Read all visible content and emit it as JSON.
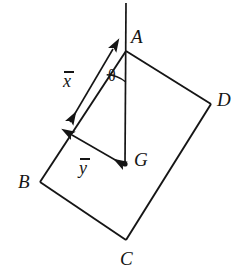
{
  "figure": {
    "background_color": "#ffffff",
    "stroke_color": "#151515",
    "canvas": {
      "width": 238,
      "height": 276
    }
  },
  "vertices": [
    {
      "id": "A",
      "label": "A",
      "point": [
        126,
        51
      ],
      "label_pos": [
        131,
        27
      ]
    },
    {
      "id": "B",
      "label": "B",
      "point": [
        40,
        182
      ],
      "label_pos": [
        18,
        172
      ]
    },
    {
      "id": "C",
      "label": "C",
      "point": [
        126,
        240
      ],
      "label_pos": [
        120,
        249
      ]
    },
    {
      "id": "D",
      "label": "D",
      "point": [
        211,
        104
      ],
      "label_pos": [
        217,
        90
      ]
    }
  ],
  "centroid": {
    "id": "G",
    "label": "G",
    "point": [
      125,
      164
    ],
    "label_pos": [
      134,
      150
    ],
    "dot_radius": 2.6
  },
  "vertical_line": {
    "name": "plumb-line",
    "from": [
      126,
      3
    ],
    "to": [
      125,
      164
    ]
  },
  "angle": {
    "label": "θ",
    "label_pos": [
      108,
      68
    ],
    "arc_center": [
      126,
      51
    ],
    "arc_radius": 31,
    "between": [
      "edge-AB",
      "plumb-line"
    ]
  },
  "dimensions": [
    {
      "id": "x-bar",
      "label": "x",
      "overbar": true,
      "label_pos": [
        63,
        72
      ],
      "arrow": {
        "from": [
          113,
          49
        ],
        "to": [
          70,
          122
        ]
      },
      "arrowheads": "both",
      "description": "distance along edge AB from A"
    },
    {
      "id": "y-bar",
      "label": "y",
      "overbar": true,
      "label_pos": [
        79,
        159
      ],
      "arrow": {
        "from": [
          72,
          135
        ],
        "to": [
          124,
          165
        ]
      },
      "arrowheads": "both",
      "description": "perpendicular distance from edge AB to G"
    }
  ],
  "edges": [
    {
      "id": "edge-AB",
      "from": "A",
      "to": "B"
    },
    {
      "id": "edge-BC",
      "from": "B",
      "to": "C"
    },
    {
      "id": "edge-CD",
      "from": "C",
      "to": "D"
    },
    {
      "id": "edge-DA",
      "from": "D",
      "to": "A"
    }
  ]
}
